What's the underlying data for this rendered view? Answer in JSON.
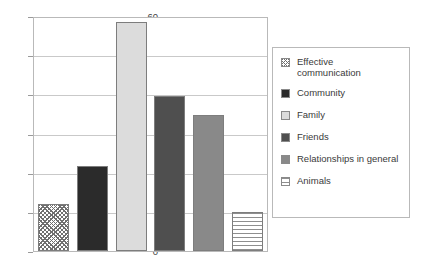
{
  "chart_data": {
    "type": "bar",
    "title": "",
    "xlabel": "",
    "ylabel": "",
    "ylim": [
      0,
      60
    ],
    "ytick_step": 10,
    "yticks": [
      "60",
      "50",
      "40",
      "30",
      "20",
      "10",
      "0"
    ],
    "grid": true,
    "legend_position": "right",
    "categories": [
      "Effective communication",
      "Community",
      "Family",
      "Friends",
      "Relationships in general",
      "Animals"
    ],
    "values": [
      12,
      22,
      59,
      40,
      35,
      10
    ],
    "series": [
      {
        "name": "Responses",
        "values": [
          12,
          22,
          59,
          40,
          35,
          10
        ]
      }
    ],
    "bar_styles": [
      {
        "label": "Effective communication",
        "pattern": "diagonal-crosshatch",
        "color": "#8f8f8f"
      },
      {
        "label": "Community",
        "pattern": "solid",
        "color": "#2b2b2b"
      },
      {
        "label": "Family",
        "pattern": "solid",
        "color": "#dcdcdc"
      },
      {
        "label": "Friends",
        "pattern": "solid",
        "color": "#4f4f4f"
      },
      {
        "label": "Relationships in general",
        "pattern": "solid",
        "color": "#898989"
      },
      {
        "label": "Animals",
        "pattern": "horizontal-stripes",
        "color": "#8e8e8e"
      }
    ]
  },
  "legend": {
    "items": [
      {
        "label": "Effective\ncommunication",
        "pattern": "diagonal-crosshatch",
        "color": "#8f8f8f"
      },
      {
        "label": "Community",
        "pattern": "solid",
        "color": "#2b2b2b"
      },
      {
        "label": "Family",
        "pattern": "solid",
        "color": "#dcdcdc"
      },
      {
        "label": "Friends",
        "pattern": "solid",
        "color": "#4f4f4f"
      },
      {
        "label": "Relationships in general",
        "pattern": "solid",
        "color": "#898989"
      },
      {
        "label": "Animals",
        "pattern": "horizontal-stripes",
        "color": "#8e8e8e"
      }
    ]
  },
  "axis": {
    "ticks": [
      "60",
      "50",
      "40",
      "30",
      "20",
      "10",
      "0"
    ]
  }
}
